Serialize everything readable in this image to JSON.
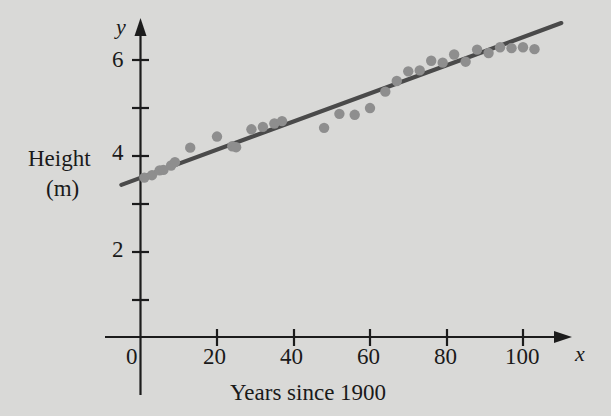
{
  "figure": {
    "background_color": "#d9d9d7",
    "axis_color": "#1c1c1c",
    "point_color": "#8e8e8e",
    "trend_color": "#4a4a4a"
  },
  "axes": {
    "y_variable": "y",
    "x_variable": "x",
    "y_axis_name_line1": "Height",
    "y_axis_name_line2": "(m)",
    "x_axis_caption": "Years since 1900",
    "origin_label": "0",
    "y_tick_labels": [
      "2",
      "4",
      "6"
    ],
    "x_tick_labels": [
      "20",
      "40",
      "60",
      "80",
      "100"
    ]
  },
  "chart_data": {
    "type": "scatter",
    "title": "",
    "xlabel": "Years since 1900",
    "ylabel": "Height (m)",
    "xlim": [
      -8,
      115
    ],
    "ylim": [
      0,
      7.0
    ],
    "grid": false,
    "legend": "none",
    "x_axis_variable": "x",
    "y_axis_variable": "y",
    "x_ticks": [
      0,
      20,
      40,
      60,
      80,
      100
    ],
    "x_ticks_labeled": [
      20,
      40,
      60,
      80,
      100
    ],
    "y_ticks": [
      1,
      2,
      3,
      4,
      5,
      6
    ],
    "y_ticks_labeled": [
      2,
      4,
      6
    ],
    "x": [
      1,
      3,
      5,
      6,
      8,
      9,
      13,
      20,
      24,
      25,
      29,
      32,
      35,
      37,
      48,
      52,
      56,
      60,
      64,
      67,
      70,
      73,
      76,
      79,
      82,
      85,
      88,
      91,
      94,
      97,
      100,
      103
    ],
    "y": [
      3.3,
      3.35,
      3.45,
      3.46,
      3.55,
      3.62,
      3.92,
      4.15,
      3.95,
      3.93,
      4.3,
      4.35,
      4.42,
      4.47,
      4.33,
      4.62,
      4.6,
      4.74,
      5.08,
      5.3,
      5.5,
      5.52,
      5.72,
      5.68,
      5.85,
      5.7,
      5.95,
      5.88,
      6.0,
      5.98,
      6.0,
      5.96
    ],
    "series": [
      {
        "name": "Observed heights",
        "type": "scatter",
        "marker": "filled-circle",
        "color": "#8e8e8e",
        "points": [
          {
            "x": 1,
            "y": 3.3
          },
          {
            "x": 3,
            "y": 3.35
          },
          {
            "x": 5,
            "y": 3.45
          },
          {
            "x": 6,
            "y": 3.46
          },
          {
            "x": 8,
            "y": 3.55
          },
          {
            "x": 9,
            "y": 3.62
          },
          {
            "x": 13,
            "y": 3.92
          },
          {
            "x": 20,
            "y": 4.15
          },
          {
            "x": 24,
            "y": 3.95
          },
          {
            "x": 25,
            "y": 3.93
          },
          {
            "x": 29,
            "y": 4.3
          },
          {
            "x": 32,
            "y": 4.35
          },
          {
            "x": 35,
            "y": 4.42
          },
          {
            "x": 37,
            "y": 4.47
          },
          {
            "x": 48,
            "y": 4.33
          },
          {
            "x": 52,
            "y": 4.62
          },
          {
            "x": 56,
            "y": 4.6
          },
          {
            "x": 60,
            "y": 4.74
          },
          {
            "x": 64,
            "y": 5.08
          },
          {
            "x": 67,
            "y": 5.3
          },
          {
            "x": 70,
            "y": 5.5
          },
          {
            "x": 73,
            "y": 5.52
          },
          {
            "x": 76,
            "y": 5.72
          },
          {
            "x": 79,
            "y": 5.68
          },
          {
            "x": 82,
            "y": 5.85
          },
          {
            "x": 85,
            "y": 5.7
          },
          {
            "x": 88,
            "y": 5.95
          },
          {
            "x": 91,
            "y": 5.88
          },
          {
            "x": 94,
            "y": 6.0
          },
          {
            "x": 97,
            "y": 5.98
          },
          {
            "x": 100,
            "y": 6.0
          },
          {
            "x": 103,
            "y": 5.96
          }
        ]
      },
      {
        "name": "Line of best fit",
        "type": "line",
        "color": "#4a4a4a",
        "slope": 0.0291,
        "intercept": 3.3,
        "x_start": -5,
        "x_end": 110,
        "y_start": 3.15,
        "y_end": 6.5
      }
    ]
  }
}
